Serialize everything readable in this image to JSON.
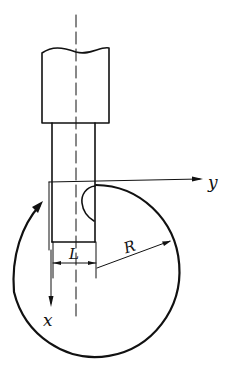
{
  "diagram": {
    "type": "technical drawing",
    "labels": {
      "axis_y": "y",
      "axis_x": "x",
      "width_dimension": "L",
      "radius": "R"
    },
    "colors": {
      "line": "#111111",
      "background": "#ffffff"
    }
  }
}
